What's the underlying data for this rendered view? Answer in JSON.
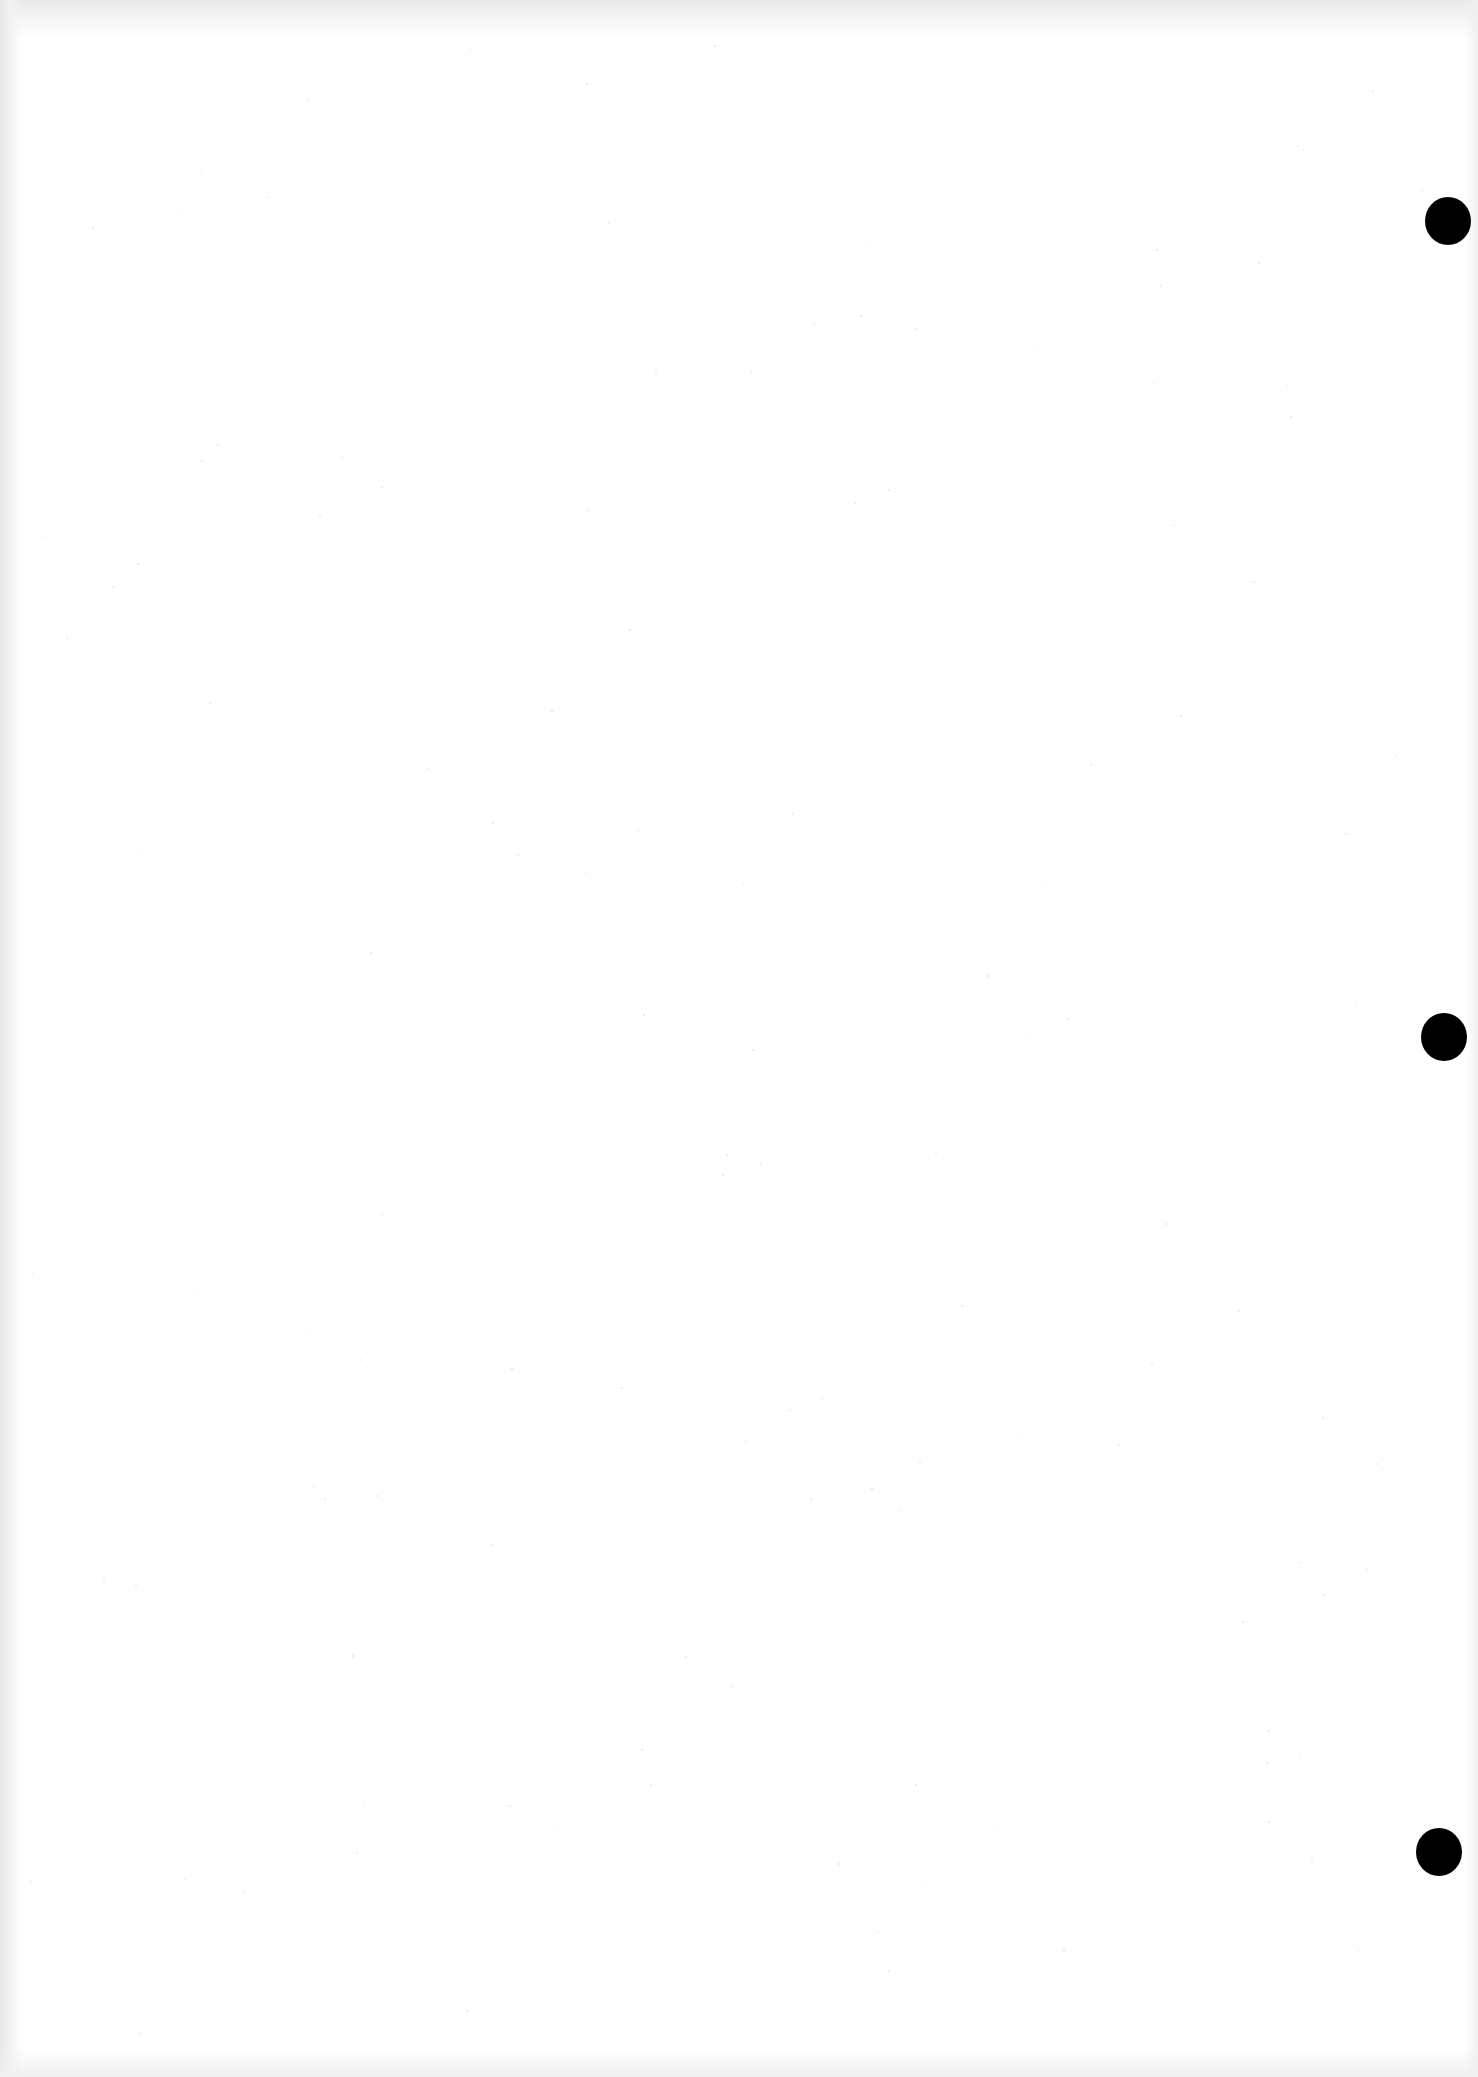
{
  "document": {
    "type": "blank-scanned-page",
    "background_color": "#ffffff",
    "text_content": ""
  },
  "punch_holes": [
    {
      "cx": 1448,
      "cy": 221,
      "w": 46,
      "h": 48,
      "color": "#000000"
    },
    {
      "cx": 1444,
      "cy": 1037,
      "w": 46,
      "h": 48,
      "color": "#000000"
    },
    {
      "cx": 1439,
      "cy": 1852,
      "w": 46,
      "h": 48,
      "color": "#000000"
    }
  ]
}
